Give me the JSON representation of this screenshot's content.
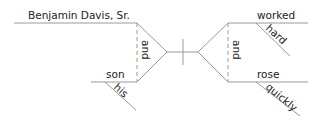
{
  "diagram": {
    "type": "sentence-diagram",
    "subjects": {
      "first": "Benjamin Davis, Sr.",
      "second": "son",
      "second_modifier": "his",
      "conjunction": "and"
    },
    "predicates": {
      "first": "worked",
      "first_modifier": "hard",
      "second": "rose",
      "second_modifier": "quickly",
      "conjunction": "and"
    },
    "colors": {
      "line": "#9a9a9a",
      "text": "#222222"
    }
  }
}
